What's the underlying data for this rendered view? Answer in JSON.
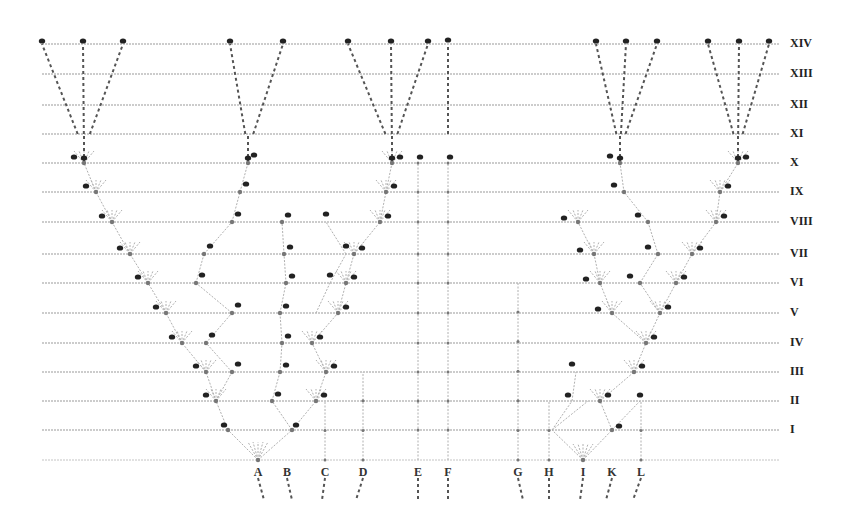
{
  "diagram": {
    "colors": {
      "line": "#9a9a9a",
      "branch": "#b0b0b0",
      "node": "#222222",
      "dashed": "#555555",
      "text": "#222222"
    },
    "generations": [
      {
        "label": "XIV",
        "y": 44
      },
      {
        "label": "XIII",
        "y": 74
      },
      {
        "label": "XII",
        "y": 105
      },
      {
        "label": "XI",
        "y": 134
      },
      {
        "label": "X",
        "y": 163
      },
      {
        "label": "IX",
        "y": 192
      },
      {
        "label": "VIII",
        "y": 222
      },
      {
        "label": "VII",
        "y": 254
      },
      {
        "label": "VI",
        "y": 283
      },
      {
        "label": "V",
        "y": 313
      },
      {
        "label": "IV",
        "y": 343
      },
      {
        "label": "III",
        "y": 372
      },
      {
        "label": "II",
        "y": 401
      },
      {
        "label": "I",
        "y": 430
      }
    ],
    "baseline_y": 460,
    "species": [
      {
        "label": "A",
        "x": 258
      },
      {
        "label": "B",
        "x": 287
      },
      {
        "label": "C",
        "x": 325
      },
      {
        "label": "D",
        "x": 363
      },
      {
        "label": "E",
        "x": 418
      },
      {
        "label": "F",
        "x": 448
      },
      {
        "label": "G",
        "x": 518
      },
      {
        "label": "H",
        "x": 549
      },
      {
        "label": "I",
        "x": 583
      },
      {
        "label": "K",
        "x": 612
      },
      {
        "label": "L",
        "x": 641
      }
    ],
    "top_tips": [
      {
        "label": "a14",
        "x": 42
      },
      {
        "label": "q14",
        "x": 83
      },
      {
        "label": "p14",
        "x": 123
      },
      {
        "label": "b14",
        "x": 230
      },
      {
        "label": "f14",
        "x": 283
      },
      {
        "label": "o14",
        "x": 348
      },
      {
        "label": "e14",
        "x": 391
      },
      {
        "label": "m14",
        "x": 428
      },
      {
        "label": "F14",
        "x": 448
      },
      {
        "label": "n14",
        "x": 596
      },
      {
        "label": "r14",
        "x": 626
      },
      {
        "label": "w14",
        "x": 657
      },
      {
        "label": "y14",
        "x": 708
      },
      {
        "label": "v14",
        "x": 739
      },
      {
        "label": "z14",
        "x": 769
      }
    ]
  }
}
